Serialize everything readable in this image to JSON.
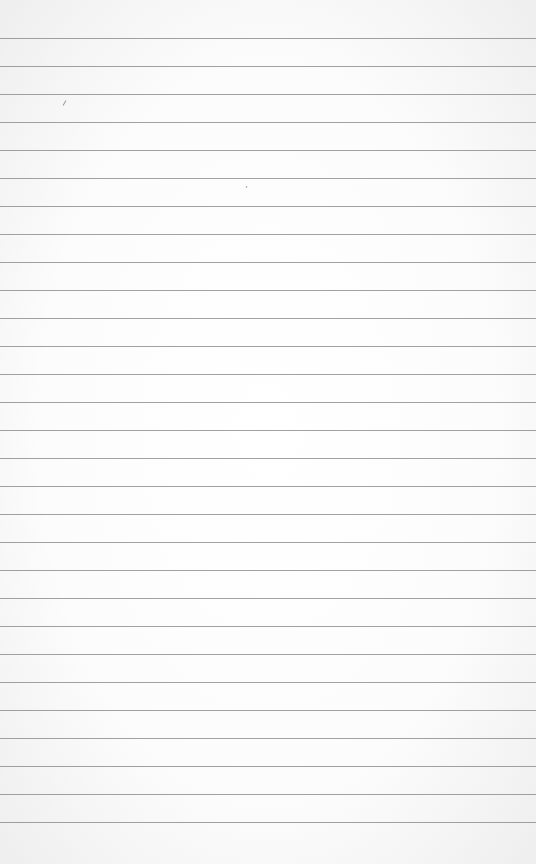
{
  "paper": {
    "description": "Blank ruled notebook paper",
    "line_count": 29,
    "first_line_y": 38,
    "line_spacing": 28,
    "line_color": "#8a8a8a",
    "background_color": "#ffffff"
  }
}
